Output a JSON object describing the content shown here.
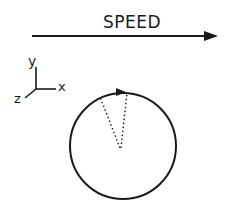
{
  "diagram": {
    "speed_label": "SPEED",
    "axes": {
      "y_label": "y",
      "x_label": "x",
      "z_label": "z"
    },
    "colors": {
      "ink": "#1a1a1a",
      "background": "#ffffff"
    },
    "elements": {
      "speed_arrow": "arrow pointing right indicating direction of travel",
      "coordinate_axes": "3D axes triad (x right, y up, z out-of-page/down-left)",
      "wheel": "circle with clockwise rotation arrow at top",
      "dotted_lines": "two dotted radii from center to rim near top"
    }
  }
}
